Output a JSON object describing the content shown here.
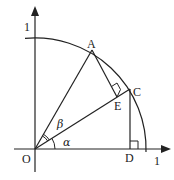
{
  "diagram": {
    "type": "unit-circle-geometry",
    "labels": {
      "origin": "O",
      "point_a": "A",
      "point_c": "C",
      "point_e": "E",
      "point_d": "D",
      "y_unit": "1",
      "x_unit": "1",
      "angle_alpha": "α",
      "angle_beta": "β"
    },
    "points": {
      "O": [
        35,
        149
      ],
      "A": [
        92,
        50
      ],
      "C": [
        130,
        89
      ],
      "E": [
        117,
        97
      ],
      "D": [
        130,
        149
      ]
    },
    "circle": {
      "center": [
        35,
        149
      ],
      "radius": 111
    },
    "colors": {
      "stroke": "#222222",
      "background": "#ffffff"
    }
  }
}
